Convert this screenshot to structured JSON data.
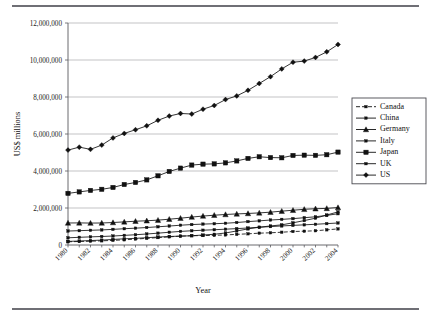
{
  "figure": {
    "kind": "line-chart-figure",
    "has_top_rule": true,
    "has_bottom_rule": true
  },
  "chart_data": {
    "type": "line",
    "title": "",
    "xlabel": "Year",
    "ylabel": "US$ millions",
    "xlim": [
      1980,
      2004
    ],
    "ylim": [
      0,
      12000000
    ],
    "ytick_step": 2000000,
    "ytick_labels": [
      "0",
      "2,000,000",
      "4,000,000",
      "6,000,000",
      "8,000,000",
      "10,000,000",
      "12,000,000"
    ],
    "ytick_values": [
      0,
      2000000,
      4000000,
      6000000,
      8000000,
      10000000,
      12000000
    ],
    "xtick_labels": [
      "1980",
      "1982",
      "1984",
      "1986",
      "1988",
      "1990",
      "1992",
      "1994",
      "1996",
      "1998",
      "2000",
      "2002",
      "2004"
    ],
    "xtick_values": [
      1980,
      1982,
      1984,
      1986,
      1988,
      1990,
      1992,
      1994,
      1996,
      1998,
      2000,
      2002,
      2004
    ],
    "x": [
      1980,
      1981,
      1982,
      1983,
      1984,
      1985,
      1986,
      1987,
      1988,
      1989,
      1990,
      1991,
      1992,
      1993,
      1994,
      1995,
      1996,
      1997,
      1998,
      1999,
      2000,
      2001,
      2002,
      2003,
      2004
    ],
    "grid": "horizontal",
    "legend_position": "right",
    "series": [
      {
        "name": "Canada",
        "marker": "small-square",
        "dash": "4 2",
        "values": [
          175000,
          190000,
          205000,
          225000,
          250000,
          280000,
          320000,
          360000,
          400000,
          440000,
          480000,
          500000,
          510000,
          520000,
          545000,
          575000,
          605000,
          640000,
          660000,
          690000,
          730000,
          745000,
          770000,
          820000,
          870000
        ]
      },
      {
        "name": "China",
        "marker": "small-square",
        "dash": "none",
        "values": [
          195000,
          215000,
          240000,
          265000,
          300000,
          335000,
          360000,
          395000,
          430000,
          460000,
          480000,
          500000,
          540000,
          580000,
          650000,
          760000,
          870000,
          960000,
          1030000,
          1090000,
          1200000,
          1320000,
          1450000,
          1620000,
          1790000
        ]
      },
      {
        "name": "Germany",
        "marker": "triangle",
        "dash": "none",
        "values": [
          1190000,
          1195000,
          1185000,
          1190000,
          1215000,
          1250000,
          1285000,
          1310000,
          1345000,
          1395000,
          1450000,
          1510000,
          1565000,
          1610000,
          1650000,
          1680000,
          1705000,
          1735000,
          1775000,
          1830000,
          1880000,
          1930000,
          1960000,
          1980000,
          2025000
        ]
      },
      {
        "name": "Italy",
        "marker": "small-square",
        "dash": "none",
        "values": [
          755000,
          775000,
          795000,
          815000,
          845000,
          880000,
          910000,
          945000,
          985000,
          1025000,
          1070000,
          1105000,
          1130000,
          1150000,
          1175000,
          1215000,
          1265000,
          1305000,
          1350000,
          1385000,
          1425000,
          1475000,
          1525000,
          1600000,
          1690000
        ]
      },
      {
        "name": "Japan",
        "marker": "square",
        "dash": "none",
        "values": [
          2790000,
          2870000,
          2950000,
          3010000,
          3110000,
          3270000,
          3380000,
          3520000,
          3740000,
          3975000,
          4155000,
          4320000,
          4370000,
          4385000,
          4440000,
          4545000,
          4680000,
          4770000,
          4725000,
          4715000,
          4840000,
          4855000,
          4845000,
          4880000,
          5020000
        ]
      },
      {
        "name": "UK",
        "marker": "small-square",
        "dash": "none",
        "values": [
          390000,
          415000,
          440000,
          460000,
          485000,
          520000,
          555000,
          595000,
          640000,
          690000,
          735000,
          770000,
          800000,
          825000,
          855000,
          885000,
          920000,
          960000,
          995000,
          1030000,
          1060000,
          1090000,
          1120000,
          1155000,
          1190000
        ]
      },
      {
        "name": "US",
        "marker": "diamond",
        "dash": "none",
        "values": [
          5130000,
          5290000,
          5170000,
          5400000,
          5790000,
          6030000,
          6230000,
          6440000,
          6740000,
          6970000,
          7110000,
          7080000,
          7340000,
          7540000,
          7860000,
          8060000,
          8360000,
          8730000,
          9100000,
          9520000,
          9880000,
          9940000,
          10140000,
          10440000,
          10840000
        ]
      }
    ]
  }
}
